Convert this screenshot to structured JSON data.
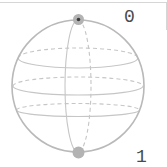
{
  "diagram": {
    "type": "qubit-bloch-sphere",
    "top_label": "0",
    "bottom_label": "1"
  },
  "colors": {
    "background": "#ffffff",
    "frame_border": "#d6d6d6",
    "sphere_outline": "#b9b9b9",
    "grid_lines": "#c6c6c6",
    "pole_marker": "#b3b3b3",
    "pole_center_dot": "#3c3c3c",
    "label_text": "#4a4a4a"
  }
}
